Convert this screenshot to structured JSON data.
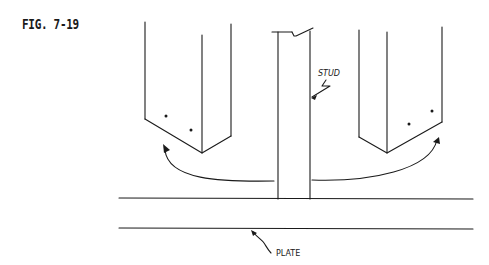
{
  "figure": {
    "label": "FIG. 7-19"
  },
  "labels": {
    "stud": "STUD",
    "plate": "PLATE"
  },
  "colors": {
    "ink": "#1a1a1a",
    "background": "#ffffff"
  }
}
